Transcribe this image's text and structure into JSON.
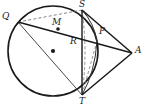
{
  "figure": {
    "background_color": "#ffffff",
    "stroke_color": "#1a1a1a",
    "dashed_color": "#555555",
    "width": 146,
    "height": 112
  },
  "circle": {
    "name": "main-circle",
    "center_x": 53,
    "center_y": 51,
    "radius": 45,
    "center_dot_label": ""
  },
  "labels": {
    "q": "Q",
    "s": "S",
    "m": "M",
    "r": "R",
    "p": "P",
    "a": "A",
    "t": "T"
  },
  "points": [
    {
      "id": "Q",
      "label": "Q",
      "x": 18,
      "y": 22,
      "label_x": 2,
      "label_y": 12,
      "on_circle": true,
      "dot": false
    },
    {
      "id": "S",
      "label": "S",
      "x": 82,
      "y": 10,
      "label_x": 79,
      "label_y": 0,
      "on_circle": true,
      "dot": false
    },
    {
      "id": "M",
      "label": "M",
      "x": 58,
      "y": 29,
      "label_x": 53,
      "label_y": 19,
      "on_circle": false,
      "dot": true
    },
    {
      "id": "R",
      "label": "R",
      "x": 82,
      "y": 41,
      "label_x": 70,
      "label_y": 37,
      "on_circle": false,
      "dot": false
    },
    {
      "id": "P",
      "label": "P",
      "x": 97,
      "y": 41,
      "label_x": 99,
      "label_y": 27,
      "on_circle": true,
      "dot": false
    },
    {
      "id": "A",
      "label": "A",
      "x": 132,
      "y": 53,
      "label_x": 135,
      "label_y": 47,
      "on_circle": false,
      "dot": false
    },
    {
      "id": "T",
      "label": "T",
      "x": 82,
      "y": 95,
      "label_x": 79,
      "label_y": 97,
      "on_circle": true,
      "dot": false
    },
    {
      "id": "O",
      "label": "",
      "x": 53,
      "y": 51,
      "label_x": 53,
      "label_y": 51,
      "on_circle": false,
      "dot": true
    }
  ],
  "segments": [
    {
      "id": "qa-secant",
      "from": "Q",
      "to": "A",
      "style": "solid",
      "width": 1.4
    },
    {
      "id": "st-chord",
      "from": "S",
      "to": "T",
      "style": "solid",
      "width": 1.4
    },
    {
      "id": "sa-tangent",
      "from": "S",
      "to": "A",
      "style": "solid",
      "width": 1.4
    },
    {
      "id": "ta-tangent",
      "from": "T",
      "to": "A",
      "style": "solid",
      "width": 1.4
    },
    {
      "id": "qt-chord",
      "from": "Q",
      "to": "T",
      "style": "solid",
      "width": 1.0
    },
    {
      "id": "qs-chord",
      "from": "Q",
      "to": "S",
      "style": "dashed",
      "width": 0.9
    },
    {
      "id": "sp-chord",
      "from": "S",
      "to": "P",
      "style": "solid",
      "width": 1.0
    },
    {
      "id": "pt-chord",
      "from": "P",
      "to": "T",
      "style": "solid",
      "width": 1.0
    },
    {
      "id": "st-dashed",
      "from": "S",
      "to": "T",
      "style": "dashed",
      "width": 0.9
    }
  ]
}
